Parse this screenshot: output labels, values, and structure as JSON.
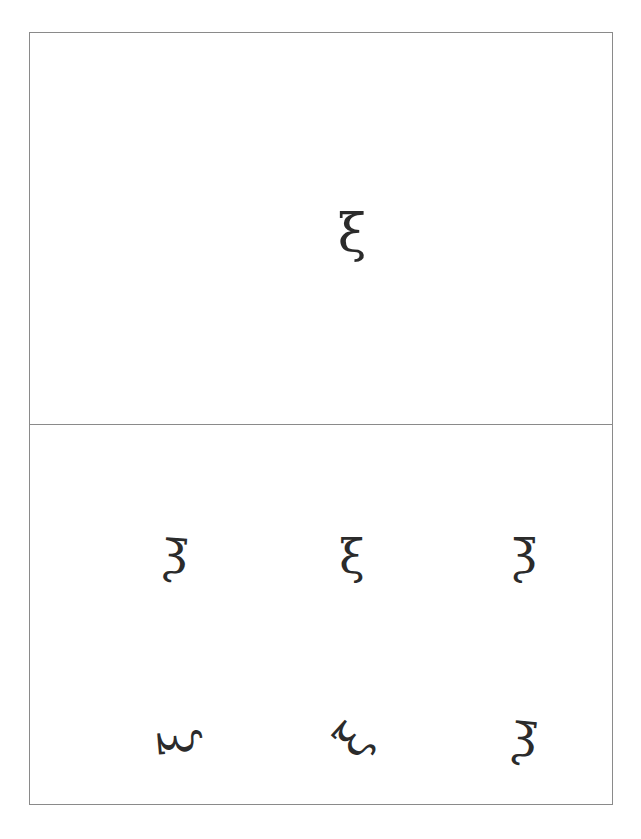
{
  "figure": {
    "border_color": "#8a8a8a",
    "background_color": "#ffffff",
    "glyph_color": "#2b2b2b"
  },
  "panels": {
    "top": {
      "name": "reference-panel",
      "glyph": {
        "character": "ξ",
        "unicode_name": "greek-small-letter-xi",
        "orientation": "upright",
        "rotation_degrees": 0,
        "mirrored": false
      }
    },
    "bottom": {
      "name": "variants-panel",
      "rows": [
        {
          "cells": [
            {
              "character": "ξ",
              "unicode_name": "greek-small-letter-xi",
              "orientation": "mirrored-upright",
              "rotation_degrees": -4,
              "mirrored": true
            },
            {
              "character": "ξ",
              "unicode_name": "greek-small-letter-xi",
              "orientation": "upright",
              "rotation_degrees": 0,
              "mirrored": false
            },
            {
              "character": "ξ",
              "unicode_name": "greek-small-letter-xi",
              "orientation": "mirrored-upright",
              "rotation_degrees": 0,
              "mirrored": true
            }
          ]
        },
        {
          "cells": [
            {
              "character": "ξ",
              "unicode_name": "greek-small-letter-xi",
              "orientation": "rotated-quarter-turn-left",
              "rotation_degrees": -95,
              "mirrored": false
            },
            {
              "character": "ξ",
              "unicode_name": "greek-small-letter-xi",
              "orientation": "rotated-diagonal-left",
              "rotation_degrees": -48,
              "mirrored": false
            },
            {
              "character": "ξ",
              "unicode_name": "greek-small-letter-xi",
              "orientation": "mirrored-upright",
              "rotation_degrees": -6,
              "mirrored": true
            }
          ]
        }
      ]
    }
  }
}
